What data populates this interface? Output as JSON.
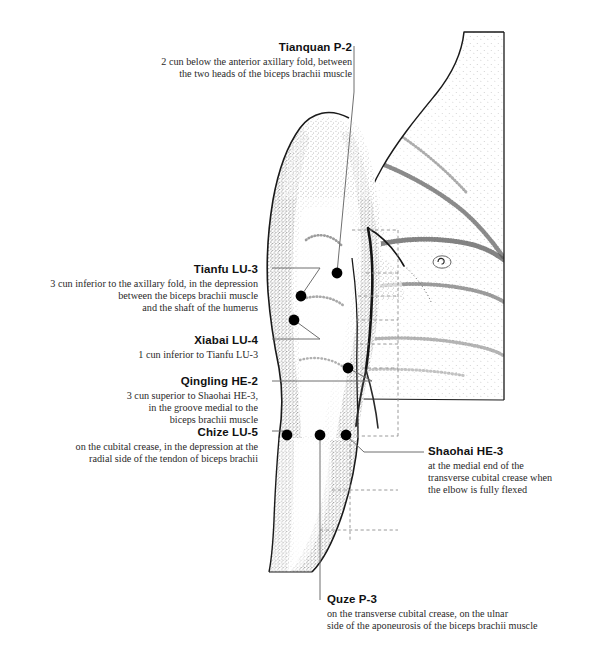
{
  "figure": {
    "ink_color": "#111111",
    "stipple_color": "#3a3a3a",
    "leader_color": "#6a6a6a",
    "dash_color": "#8a8a8a"
  },
  "labels": {
    "tianquan": {
      "name": "Tianquan P-2",
      "description": "2 cun below the anterior axillary fold, between\nthe two heads of the biceps brachii muscle",
      "align": "right"
    },
    "tianfu": {
      "name": "Tianfu LU-3",
      "description": "3 cun inferior to the axillary fold, in the depression\nbetween the biceps brachii muscle\nand the shaft of the humerus",
      "align": "right"
    },
    "xiabai": {
      "name": "Xiabai LU-4",
      "description": "1 cun inferior to Tianfu LU-3",
      "align": "right"
    },
    "qingling": {
      "name": "Qingling HE-2",
      "description": "3 cun superior to Shaohai HE-3,\nin the groove medial to the\nbiceps brachii muscle",
      "align": "right"
    },
    "chize": {
      "name": "Chize LU-5",
      "description": "on the cubital crease, in the depression at the\nradial side of the tendon of biceps brachii",
      "align": "right"
    },
    "shaohai": {
      "name": "Shaohai HE-3",
      "description": "at the medial end of the\ntransverse cubital crease when\nthe elbow is fully flexed",
      "align": "left"
    },
    "quze": {
      "name": "Quze P-3",
      "description": "on the transverse cubital crease, on the ulnar\nside of the aponeurosis of the biceps brachii muscle",
      "align": "left"
    }
  },
  "points": [
    {
      "id": "tianquan",
      "label": "Tianquan P-2",
      "x": 337,
      "y": 273
    },
    {
      "id": "tianfu",
      "label": "Tianfu LU-3",
      "x": 301,
      "y": 296
    },
    {
      "id": "xiabai",
      "label": "Xiabai LU-4",
      "x": 294,
      "y": 320
    },
    {
      "id": "qingling",
      "label": "Qingling HE-2",
      "x": 348,
      "y": 368
    },
    {
      "id": "chize",
      "label": "Chize LU-5",
      "x": 287,
      "y": 435
    },
    {
      "id": "quze",
      "label": "Quze P-3",
      "x": 320,
      "y": 435
    },
    {
      "id": "shaohai",
      "label": "Shaohai HE-3",
      "x": 346,
      "y": 435
    }
  ]
}
